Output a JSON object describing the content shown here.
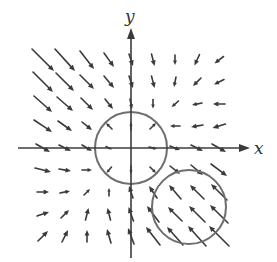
{
  "figure": {
    "x_axis_label": "x",
    "y_axis_label": "y",
    "colors": {
      "axis": "#3c3c3c",
      "circle": "#6e6e6e",
      "arrow": "#3a3a3a",
      "background": "#ffffff"
    }
  },
  "chart_data": {
    "type": "vector_field",
    "title": "",
    "xlabel": "x",
    "ylabel": "y",
    "origin_px": [
      131,
      148
    ],
    "grid_spacing_px": 22,
    "grid_range": [
      -4,
      4
    ],
    "axes": {
      "x": {
        "from_px": [
          18,
          148
        ],
        "to_px": [
          250,
          148
        ],
        "arrow": true
      },
      "y": {
        "from_px": [
          131,
          258
        ],
        "to_px": [
          131,
          28
        ],
        "arrow": true
      }
    },
    "label_positions_px": {
      "x": [
        254,
        154
      ],
      "y": [
        125,
        22
      ]
    },
    "circles": [
      {
        "name": "circle-at-origin",
        "center_grid": [
          0,
          0
        ],
        "center_px": [
          131,
          148
        ],
        "radius_px": 36
      },
      {
        "name": "circle-lower-right",
        "center_grid": [
          2.6,
          -2.7
        ],
        "center_px": [
          189,
          207
        ],
        "radius_px": 37
      }
    ],
    "vectors_note": "Each vector: [i, j, dx_px, dy_px] where grid point (i,j) and screen displacement (dy positive = down)",
    "vectors": [
      [
        -4,
        4,
        22,
        22
      ],
      [
        -3,
        4,
        20,
        22
      ],
      [
        -2,
        4,
        14,
        18
      ],
      [
        -1,
        4,
        10,
        14
      ],
      [
        0,
        4,
        4,
        12
      ],
      [
        1,
        4,
        3,
        12
      ],
      [
        2,
        4,
        0,
        10
      ],
      [
        3,
        4,
        -5,
        11
      ],
      [
        4,
        4,
        -9,
        7
      ],
      [
        -4,
        3,
        20,
        20
      ],
      [
        -3,
        3,
        18,
        18
      ],
      [
        -2,
        3,
        14,
        14
      ],
      [
        -1,
        3,
        10,
        12
      ],
      [
        0,
        3,
        4,
        12
      ],
      [
        1,
        3,
        3,
        12
      ],
      [
        2,
        3,
        -2,
        10
      ],
      [
        3,
        3,
        -8,
        8
      ],
      [
        4,
        3,
        -10,
        5
      ],
      [
        -4,
        2,
        18,
        16
      ],
      [
        -3,
        2,
        16,
        14
      ],
      [
        -2,
        2,
        12,
        12
      ],
      [
        -1,
        2,
        8,
        10
      ],
      [
        0,
        2,
        2,
        10
      ],
      [
        1,
        2,
        0,
        9
      ],
      [
        2,
        2,
        -7,
        6
      ],
      [
        3,
        2,
        -10,
        2
      ],
      [
        4,
        2,
        -12,
        0
      ],
      [
        -4,
        1,
        18,
        12
      ],
      [
        -3,
        1,
        14,
        10
      ],
      [
        -2,
        1,
        10,
        8
      ],
      [
        -1,
        1,
        -6,
        -6
      ],
      [
        0,
        1,
        0,
        -8
      ],
      [
        1,
        1,
        6,
        -6
      ],
      [
        2,
        1,
        -10,
        0
      ],
      [
        3,
        1,
        -12,
        2
      ],
      [
        4,
        1,
        -13,
        4
      ],
      [
        -4,
        0,
        14,
        8
      ],
      [
        -3,
        0,
        12,
        6
      ],
      [
        -2,
        0,
        10,
        6
      ],
      [
        -1,
        0,
        6,
        3
      ],
      [
        1,
        0,
        8,
        2
      ],
      [
        2,
        0,
        10,
        4
      ],
      [
        3,
        0,
        12,
        6
      ],
      [
        4,
        0,
        14,
        8
      ],
      [
        -4,
        -1,
        16,
        4
      ],
      [
        -3,
        -1,
        12,
        2
      ],
      [
        -2,
        -1,
        10,
        0
      ],
      [
        -1,
        -1,
        -5,
        6
      ],
      [
        0,
        -1,
        0,
        8
      ],
      [
        1,
        -1,
        6,
        6
      ],
      [
        2,
        -1,
        10,
        8
      ],
      [
        3,
        -1,
        12,
        10
      ],
      [
        4,
        -1,
        16,
        12
      ],
      [
        -4,
        -2,
        12,
        0
      ],
      [
        -3,
        -2,
        10,
        -2
      ],
      [
        -2,
        -2,
        6,
        -6
      ],
      [
        -1,
        -2,
        0,
        -8
      ],
      [
        0,
        -2,
        -4,
        -12
      ],
      [
        1,
        -2,
        -8,
        -12
      ],
      [
        2,
        -2,
        -12,
        -14
      ],
      [
        3,
        -2,
        -14,
        -14
      ],
      [
        4,
        -2,
        -16,
        -16
      ],
      [
        -4,
        -3,
        12,
        -4
      ],
      [
        -3,
        -3,
        8,
        -8
      ],
      [
        -2,
        -3,
        3,
        -12
      ],
      [
        -1,
        -3,
        -3,
        -12
      ],
      [
        0,
        -3,
        -5,
        -14
      ],
      [
        1,
        -3,
        -12,
        -16
      ],
      [
        2,
        -3,
        -14,
        -14
      ],
      [
        3,
        -3,
        -16,
        -16
      ],
      [
        4,
        -3,
        -18,
        -18
      ],
      [
        -4,
        -4,
        10,
        -10
      ],
      [
        -3,
        -4,
        6,
        -12
      ],
      [
        -2,
        -4,
        0,
        -12
      ],
      [
        -1,
        -4,
        -4,
        -14
      ],
      [
        0,
        -4,
        -6,
        -16
      ],
      [
        1,
        -4,
        -14,
        -18
      ],
      [
        2,
        -4,
        -16,
        -18
      ],
      [
        3,
        -4,
        -18,
        -20
      ],
      [
        4,
        -4,
        -20,
        -20
      ]
    ]
  }
}
